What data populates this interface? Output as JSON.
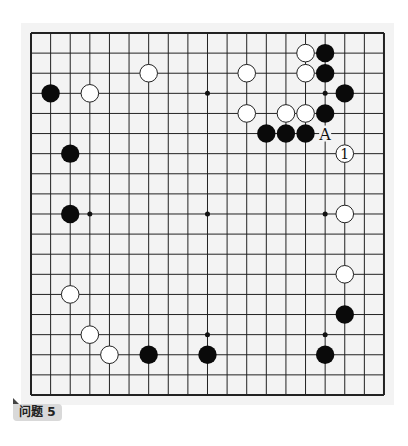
{
  "board": {
    "size": 19,
    "origin_x": 31,
    "origin_y": 33,
    "spacing_x": 19.61,
    "spacing_y": 20.11,
    "line_color": "#222222",
    "star_points": [
      [
        9,
        3
      ],
      [
        15,
        3
      ],
      [
        3,
        9
      ],
      [
        9,
        9
      ],
      [
        15,
        9
      ],
      [
        9,
        15
      ],
      [
        15,
        15
      ]
    ],
    "black_stones": [
      [
        1,
        3
      ],
      [
        2,
        6
      ],
      [
        2,
        9
      ],
      [
        6,
        16
      ],
      [
        9,
        16
      ],
      [
        15,
        16
      ],
      [
        16,
        14
      ],
      [
        15,
        1
      ],
      [
        15,
        2
      ],
      [
        16,
        3
      ],
      [
        15,
        4
      ],
      [
        12,
        5
      ],
      [
        13,
        5
      ],
      [
        14,
        5
      ]
    ],
    "white_stones": [
      [
        3,
        3
      ],
      [
        6,
        2
      ],
      [
        11,
        2
      ],
      [
        11,
        4
      ],
      [
        14,
        1
      ],
      [
        14,
        2
      ],
      [
        13,
        4
      ],
      [
        14,
        4
      ],
      [
        16,
        9
      ],
      [
        16,
        12
      ],
      [
        2,
        13
      ],
      [
        3,
        15
      ],
      [
        4,
        16
      ]
    ],
    "numbered_stones": [
      {
        "col": 16,
        "row": 6,
        "color": "white",
        "label": "1"
      }
    ],
    "letter_marks": [
      {
        "col": 15,
        "row": 5,
        "label": "A"
      }
    ]
  },
  "caption": {
    "label": "问题 5"
  }
}
